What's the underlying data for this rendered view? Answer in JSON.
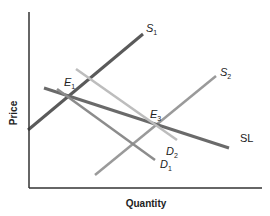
{
  "axes": {
    "x_label": "Quantity",
    "y_label": "Price",
    "origin": [
      29,
      188
    ],
    "x_end": [
      262,
      188
    ],
    "y_end": [
      29,
      12
    ],
    "color": "#333333"
  },
  "lines": [
    {
      "id": "S1",
      "label": "S",
      "sub": "1",
      "x1": 28,
      "y1": 130,
      "x2": 143,
      "y2": 34,
      "color": "#5a5a5a",
      "width": 3,
      "label_x": 146,
      "label_y": 32
    },
    {
      "id": "S2",
      "label": "S",
      "sub": "2",
      "x1": 95,
      "y1": 175,
      "x2": 216,
      "y2": 76,
      "color": "#9a9a9a",
      "width": 2.5,
      "label_x": 220,
      "label_y": 76
    },
    {
      "id": "SL",
      "label": "SL",
      "sub": "",
      "x1": 44,
      "y1": 88,
      "x2": 229,
      "y2": 148,
      "color": "#6a6a6a",
      "width": 3,
      "label_x": 240,
      "label_y": 142
    },
    {
      "id": "D1",
      "label": "D",
      "sub": "1",
      "x1": 57,
      "y1": 89,
      "x2": 155,
      "y2": 160,
      "color": "#8c8c8c",
      "width": 2.5,
      "label_x": 160,
      "label_y": 168
    },
    {
      "id": "D2",
      "label": "D",
      "sub": "2",
      "x1": 76,
      "y1": 69,
      "x2": 177,
      "y2": 140,
      "color": "#bdbdbd",
      "width": 2.5,
      "label_x": 166,
      "label_y": 155
    }
  ],
  "points": [
    {
      "id": "E1",
      "label": "E",
      "sub": "1",
      "label_x": 64,
      "label_y": 86
    },
    {
      "id": "E3",
      "label": "E",
      "sub": "3",
      "label_x": 150,
      "label_y": 118
    }
  ]
}
